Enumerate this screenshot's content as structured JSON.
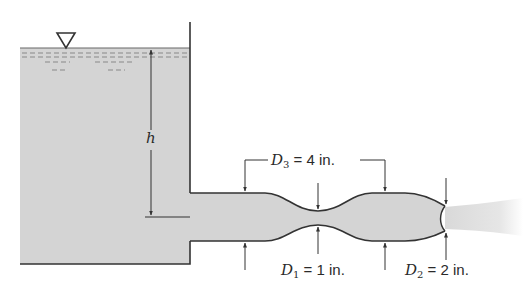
{
  "figure": {
    "type": "tank-with-nozzle-flow-diagram",
    "colors": {
      "fluid": "#d4d4d4",
      "line": "#333333",
      "jet": "#e2e2e2",
      "background": "#ffffff"
    },
    "symbols": {
      "free_surface": "inverted-triangle"
    },
    "labels": {
      "head": {
        "var": "h"
      },
      "d3": {
        "var": "D",
        "sub": "3",
        "eq": " = 4 in."
      },
      "d1": {
        "var": "D",
        "sub": "1",
        "eq": " = 1 in."
      },
      "d2": {
        "var": "D",
        "sub": "2",
        "eq": " = 2 in."
      }
    }
  }
}
